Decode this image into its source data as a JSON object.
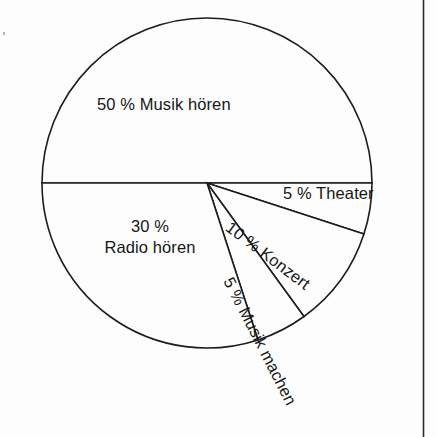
{
  "figure": {
    "background_color": "#fdfdfd",
    "line_color": "#1c1c1c",
    "text_color": "#161616"
  },
  "page_rule": {
    "name": "column-border",
    "x": 423
  },
  "chart_data": {
    "type": "pie",
    "title": "",
    "subtitle": "",
    "xlabel": "",
    "ylabel": "",
    "grid": false,
    "legend_position": "none",
    "unit": "%",
    "total": 100,
    "center": {
      "x": 207,
      "y": 183
    },
    "radius": 165,
    "start_angle_deg": 0,
    "direction": "clockwise",
    "categories": [
      "Musik hören",
      "Theater",
      "Konzert",
      "Musik machen",
      "Radio hören"
    ],
    "values": [
      50,
      5,
      10,
      5,
      30
    ],
    "slices": [
      {
        "label": "50 % Musik hören",
        "percent_text": "50 %",
        "name": "Musik hören",
        "value": 50,
        "angle_span_deg": 180,
        "start_deg": 180,
        "end_deg": 360,
        "label_placement": "inside",
        "label_rotation_deg": 0
      },
      {
        "label": "5 % Theater",
        "percent_text": "5 %",
        "name": "Theater",
        "value": 5,
        "angle_span_deg": 18,
        "start_deg": 0,
        "end_deg": 18,
        "label_placement": "outside",
        "label_rotation_deg": 0
      },
      {
        "label": "10 % Konzert",
        "percent_text": "10 %",
        "name": "Konzert",
        "value": 10,
        "angle_span_deg": 36,
        "start_deg": 18,
        "end_deg": 54,
        "label_placement": "inside",
        "label_rotation_deg": 37
      },
      {
        "label": "5 % Musik machen",
        "percent_text": "5 %",
        "name": "Musik machen",
        "value": 5,
        "angle_span_deg": 18,
        "start_deg": 54,
        "end_deg": 72,
        "label_placement": "inside-overflow",
        "label_rotation_deg": 63
      },
      {
        "label_line_1": "30 %",
        "label_line_2": "Radio hören",
        "percent_text": "30 %",
        "name": "Radio hören",
        "value": 30,
        "angle_span_deg": 108,
        "start_deg": 72,
        "end_deg": 180,
        "label_placement": "inside",
        "label_rotation_deg": 0
      }
    ]
  },
  "labels": {
    "musik_hoeren": "50 % Musik hören",
    "radio_hoeren_line1": "30 %",
    "radio_hoeren_line2": "Radio hören",
    "theater": "5 % Theater",
    "konzert": "10 % Konzert",
    "musik_machen": "5 % Musik machen"
  }
}
